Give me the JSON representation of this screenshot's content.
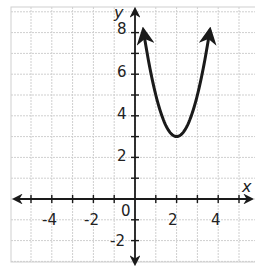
{
  "chart_data": {
    "type": "line",
    "title": "",
    "xlabel": "x",
    "ylabel": "y",
    "xlim": [
      -5.9,
      5.8
    ],
    "ylim": [
      -3.0,
      9.2
    ],
    "grid": true,
    "x_ticks": [
      -4,
      -2,
      2,
      4
    ],
    "y_ticks": [
      -2,
      2,
      4,
      6,
      8
    ],
    "origin_label": "0",
    "series": [
      {
        "name": "parabola",
        "equation": "y = 2(x - 2)^2 + 3",
        "vertex": [
          2,
          3
        ],
        "x": [
          0.4,
          0.6,
          0.8,
          1.0,
          1.2,
          1.4,
          1.6,
          1.8,
          2.0,
          2.2,
          2.4,
          2.6,
          2.8,
          3.0,
          3.2,
          3.4,
          3.6
        ],
        "values": [
          8.12,
          6.92,
          5.88,
          5.0,
          4.28,
          3.72,
          3.32,
          3.08,
          3.0,
          3.08,
          3.32,
          3.72,
          4.28,
          5.0,
          5.88,
          6.92,
          8.12
        ],
        "arrows_on_ends": true
      }
    ]
  },
  "labels": {
    "x_axis": "x",
    "y_axis": "y",
    "origin": "0",
    "x_ticks": [
      "-4",
      "-2",
      "2",
      "4"
    ],
    "y_ticks": [
      "8",
      "6",
      "4",
      "2",
      "-2"
    ]
  },
  "colors": {
    "grid": "#cfcfcf",
    "axis": "#1a1a1a",
    "curve": "#1a1a1a"
  }
}
